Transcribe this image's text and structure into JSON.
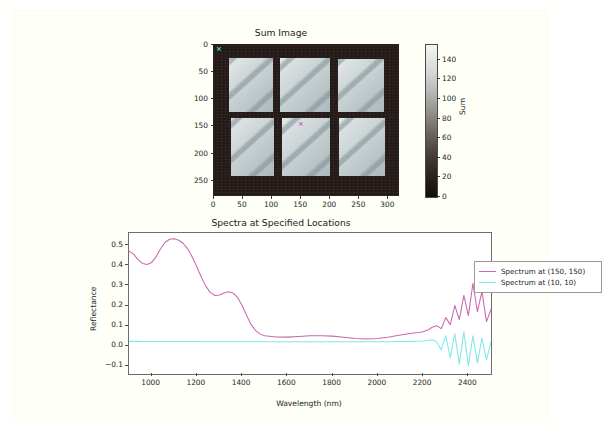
{
  "figure": {
    "background": "#fefff7"
  },
  "sum_image": {
    "title": "Sum Image",
    "xticks": [
      "0",
      "50",
      "100",
      "150",
      "200",
      "250",
      "300"
    ],
    "yticks": [
      "0",
      "50",
      "100",
      "150",
      "200",
      "250"
    ],
    "xlim": [
      0,
      320
    ],
    "ylim": [
      280,
      0
    ],
    "colorbar": {
      "label": "Sum",
      "ticks": [
        "0",
        "20",
        "40",
        "60",
        "80",
        "100",
        "120",
        "140"
      ],
      "vmin": 0,
      "vmax": 155,
      "cmap": "gray"
    },
    "markers": [
      {
        "name": "marker-10-10",
        "x": 10,
        "y": 10,
        "glyph": "×",
        "color": "#2ee8e0"
      },
      {
        "name": "marker-150-150",
        "x": 150,
        "y": 150,
        "glyph": "×",
        "color": "#d94fb4"
      }
    ]
  },
  "spectra": {
    "title": "Spectra at Specified Locations",
    "xlabel": "Wavelength (nm)",
    "ylabel": "Reflectance",
    "xticks": [
      "1000",
      "1200",
      "1400",
      "1600",
      "1800",
      "2000",
      "2200",
      "2400"
    ],
    "yticks": [
      "-0.1",
      "0.0",
      "0.1",
      "0.2",
      "0.3",
      "0.4",
      "0.5"
    ],
    "legend": [
      {
        "label": "Spectrum at (150, 150)",
        "color": "#cc66b0"
      },
      {
        "label": "Spectrum at (10, 10)",
        "color": "#7fe8e8"
      }
    ]
  },
  "chart_data": [
    {
      "type": "heatmap",
      "title": "Sum Image",
      "xlabel": "",
      "ylabel": "",
      "xlim": [
        0,
        320
      ],
      "ylim": [
        280,
        0
      ],
      "xticks": [
        0,
        50,
        100,
        150,
        200,
        250,
        300
      ],
      "yticks": [
        0,
        50,
        100,
        150,
        200,
        250
      ],
      "colorbar_label": "Sum",
      "colorbar_ticks": [
        0,
        20,
        40,
        60,
        80,
        100,
        120,
        140
      ],
      "cmap": "gray",
      "vmin": 0,
      "vmax": 155,
      "description": "Grayscale sum-intensity image of a 3x2 grid of bright rectangular panels with diagonal streak texture on a dark background",
      "annotations": [
        {
          "text": "x",
          "x": 10,
          "y": 10,
          "color": "#2ee8e0"
        },
        {
          "text": "x",
          "x": 150,
          "y": 150,
          "color": "#d94fb4"
        }
      ]
    },
    {
      "type": "line",
      "title": "Spectra at Specified Locations",
      "xlabel": "Wavelength (nm)",
      "ylabel": "Reflectance",
      "xlim": [
        900,
        2500
      ],
      "ylim": [
        -0.14,
        0.56
      ],
      "xticks": [
        1000,
        1200,
        1400,
        1600,
        1800,
        2000,
        2200,
        2400
      ],
      "yticks": [
        -0.1,
        0.0,
        0.1,
        0.2,
        0.3,
        0.4,
        0.5
      ],
      "grid": false,
      "legend_position": "upper right",
      "x": [
        900,
        920,
        940,
        960,
        980,
        1000,
        1020,
        1040,
        1060,
        1080,
        1100,
        1120,
        1140,
        1160,
        1180,
        1200,
        1220,
        1240,
        1260,
        1280,
        1300,
        1320,
        1340,
        1360,
        1380,
        1400,
        1420,
        1440,
        1460,
        1480,
        1500,
        1550,
        1600,
        1650,
        1700,
        1750,
        1800,
        1850,
        1900,
        1950,
        2000,
        2050,
        2100,
        2150,
        2180,
        2200,
        2220,
        2240,
        2260,
        2280,
        2300,
        2320,
        2340,
        2360,
        2380,
        2400,
        2420,
        2440,
        2460,
        2480,
        2500
      ],
      "series": [
        {
          "name": "Spectrum at (150, 150)",
          "color": "#cc66b0",
          "values": [
            0.47,
            0.455,
            0.428,
            0.409,
            0.404,
            0.414,
            0.443,
            0.483,
            0.514,
            0.529,
            0.531,
            0.524,
            0.508,
            0.48,
            0.44,
            0.392,
            0.34,
            0.295,
            0.264,
            0.25,
            0.252,
            0.262,
            0.268,
            0.262,
            0.24,
            0.2,
            0.15,
            0.105,
            0.075,
            0.058,
            0.05,
            0.044,
            0.043,
            0.046,
            0.05,
            0.05,
            0.048,
            0.042,
            0.036,
            0.034,
            0.036,
            0.044,
            0.054,
            0.062,
            0.066,
            0.07,
            0.078,
            0.092,
            0.1,
            0.085,
            0.14,
            0.105,
            0.2,
            0.13,
            0.25,
            0.15,
            0.31,
            0.17,
            0.27,
            0.12,
            0.18
          ]
        },
        {
          "name": "Spectrum at (10, 10)",
          "color": "#7fe8e8",
          "values": [
            0.022,
            0.022,
            0.022,
            0.021,
            0.021,
            0.021,
            0.021,
            0.021,
            0.021,
            0.021,
            0.021,
            0.021,
            0.021,
            0.021,
            0.021,
            0.021,
            0.02,
            0.02,
            0.02,
            0.02,
            0.02,
            0.02,
            0.02,
            0.02,
            0.02,
            0.02,
            0.02,
            0.02,
            0.02,
            0.02,
            0.02,
            0.02,
            0.02,
            0.02,
            0.02,
            0.02,
            0.02,
            0.02,
            0.02,
            0.02,
            0.02,
            0.02,
            0.021,
            0.022,
            0.023,
            0.024,
            0.026,
            0.03,
            0.02,
            -0.02,
            0.05,
            -0.06,
            0.06,
            -0.09,
            0.07,
            -0.1,
            0.05,
            -0.085,
            0.04,
            -0.07,
            0.02
          ]
        }
      ]
    }
  ]
}
